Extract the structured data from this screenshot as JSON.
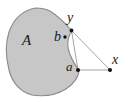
{
  "figure": {
    "type": "geometric-diagram",
    "canvas": {
      "width": 128,
      "height": 102,
      "background": "#ffffff"
    },
    "region": {
      "name": "A",
      "label": "A",
      "fill_color": "#c7c7c7",
      "stroke_color": "#8a8a8a",
      "stroke_width": 1.1,
      "path": "M 36 8 C 24 10, 14 18, 9 32 C 5 44, 6 58, 9 70 C 12 82, 20 92, 32 95 C 44 97, 56 95, 66 89 C 74 84, 79 76, 79 70 C 74 64, 70 56, 68 48 C 67 41, 69 35, 72 31 C 66 24, 58 16, 50 11 C 46 9, 41 8, 36 8 Z"
    },
    "labels": [
      {
        "id": "A",
        "text": "A",
        "x": 22,
        "y": 33,
        "size": 15,
        "role": "region-label"
      },
      {
        "id": "b",
        "text": "b",
        "x": 54,
        "y": 30,
        "size": 14,
        "role": "point-label"
      },
      {
        "id": "y",
        "text": "y",
        "x": 67,
        "y": 11,
        "size": 14,
        "role": "point-label"
      },
      {
        "id": "a",
        "text": "a",
        "x": 66,
        "y": 60,
        "size": 13,
        "role": "point-label"
      },
      {
        "id": "x",
        "text": "x",
        "x": 112,
        "y": 53,
        "size": 14,
        "role": "point-label"
      }
    ],
    "points": [
      {
        "id": "b",
        "cx": 65,
        "cy": 37,
        "r": 1.7,
        "color": "#111111"
      },
      {
        "id": "y",
        "cx": 71.5,
        "cy": 30.5,
        "r": 1.9,
        "color": "#111111"
      },
      {
        "id": "a",
        "cx": 78,
        "cy": 70,
        "r": 2.0,
        "color": "#111111"
      },
      {
        "id": "x",
        "cx": 110,
        "cy": 70,
        "r": 2.0,
        "color": "#111111"
      }
    ],
    "segments": [
      {
        "id": "y-to-x",
        "x1": 71.5,
        "y1": 30.5,
        "x2": 110,
        "y2": 70,
        "color": "#9a9a9a",
        "width": 0.9
      },
      {
        "id": "a-to-x",
        "x1": 78,
        "y1": 70,
        "x2": 110,
        "y2": 70,
        "color": "#9a9a9a",
        "width": 0.9
      },
      {
        "id": "y-to-a",
        "x1": 71.5,
        "y1": 30.5,
        "x2": 78,
        "y2": 70,
        "color": "#9a9a9a",
        "width": 0.9
      }
    ]
  }
}
